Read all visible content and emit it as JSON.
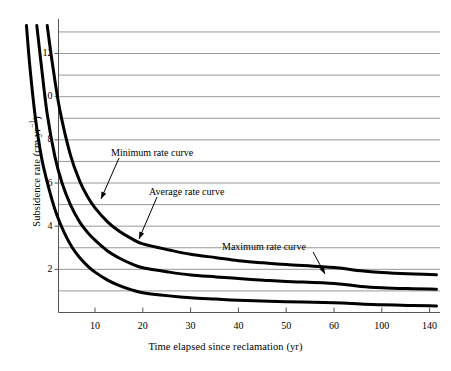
{
  "chart_data": {
    "type": "line",
    "title": "",
    "xlabel": "Time elapsed since reclamation (yr)",
    "ylabel": "Subsidence rate (cm yr-1)",
    "ylabel_main": "Subsidence rate (cm yr",
    "ylabel_sup": "−1",
    "ylabel_tail": ")",
    "xtick_labels": [
      "10",
      "20",
      "30",
      "40",
      "50",
      "60",
      "100",
      "140"
    ],
    "xtick_values": [
      10,
      20,
      30,
      40,
      50,
      60,
      100,
      140
    ],
    "ytick_labels": [
      "2",
      "4",
      "6",
      "8",
      "10",
      "12"
    ],
    "ytick_values": [
      2,
      4,
      6,
      8,
      10,
      12
    ],
    "ylim": [
      0,
      13.6
    ],
    "xlim_note": "compressed non-linear axis; ticks 10,20,30,40,50,60,100,140 drawn at equal spacing",
    "grid": "horizontal gridlines at every integer subsidence rate from 1 to 13",
    "gridlines_at": [
      1,
      2,
      3,
      4,
      5,
      6,
      7,
      8,
      9,
      10,
      11,
      12,
      13
    ],
    "legend_position": "inline annotations with leader arrows",
    "line_color": "#000000",
    "grid_color": "#8c8c8c",
    "axis_color": "#5a5a5a",
    "series": [
      {
        "name": "Maximum rate curve",
        "x": [
          5.0,
          5.4,
          6.0,
          7.0,
          8.0,
          9.0,
          10.0,
          12.0,
          14.0,
          17.0,
          20.0,
          25.0,
          30.0,
          35.0,
          40.0,
          45.0,
          50.0,
          60.0,
          80.0,
          100.0,
          120.0,
          140.0,
          147.0
        ],
        "values": [
          13.3,
          11.5,
          9.4,
          7.3,
          6.1,
          5.35,
          4.85,
          4.2,
          3.8,
          3.42,
          3.18,
          2.9,
          2.7,
          2.54,
          2.4,
          2.3,
          2.22,
          2.08,
          1.93,
          1.85,
          1.79,
          1.76,
          1.75
        ]
      },
      {
        "name": "Average rate curve",
        "x": [
          4.3,
          4.6,
          5.0,
          5.6,
          6.2,
          7.0,
          8.0,
          9.0,
          10.0,
          12.0,
          14.0,
          17.0,
          20.0,
          25.0,
          30.0,
          35.0,
          40.0,
          45.0,
          50.0,
          60.0,
          80.0,
          100.0,
          120.0,
          140.0,
          147.0
        ],
        "values": [
          13.3,
          11.4,
          9.2,
          7.2,
          6.0,
          5.0,
          4.2,
          3.7,
          3.35,
          2.85,
          2.55,
          2.25,
          2.07,
          1.87,
          1.74,
          1.65,
          1.57,
          1.5,
          1.44,
          1.34,
          1.21,
          1.15,
          1.11,
          1.09,
          1.08
        ]
      },
      {
        "name": "Minimum rate curve",
        "x": [
          3.7,
          3.9,
          4.2,
          4.6,
          5.1,
          5.7,
          6.4,
          7.2,
          8.0,
          9.0,
          10.0,
          12.0,
          14.0,
          17.0,
          20.0,
          25.0,
          30.0,
          35.0,
          40.0,
          50.0,
          60.0,
          80.0,
          100.0,
          120.0,
          140.0,
          147.0
        ],
        "values": [
          13.3,
          11.3,
          9.1,
          7.2,
          5.8,
          4.6,
          3.7,
          3.0,
          2.55,
          2.15,
          1.87,
          1.5,
          1.27,
          1.05,
          0.92,
          0.77,
          0.68,
          0.62,
          0.57,
          0.5,
          0.45,
          0.39,
          0.36,
          0.33,
          0.31,
          0.3
        ]
      }
    ],
    "annotations": [
      {
        "text": "Minimum rate curve",
        "label_x": 111,
        "label_y": 147,
        "arrow_from_x": 119,
        "arrow_from_y": 158,
        "arrow_to_x": 101,
        "arrow_to_y": 199
      },
      {
        "text": "Average rate curve",
        "label_x": 149,
        "label_y": 186,
        "arrow_from_x": 157,
        "arrow_from_y": 197,
        "arrow_to_x": 139,
        "arrow_to_y": 239
      },
      {
        "text": "Maximum rate curve",
        "label_x": 222,
        "label_y": 241,
        "arrow_from_x": 313,
        "arrow_from_y": 252,
        "arrow_to_x": 325,
        "arrow_to_y": 274
      }
    ]
  }
}
